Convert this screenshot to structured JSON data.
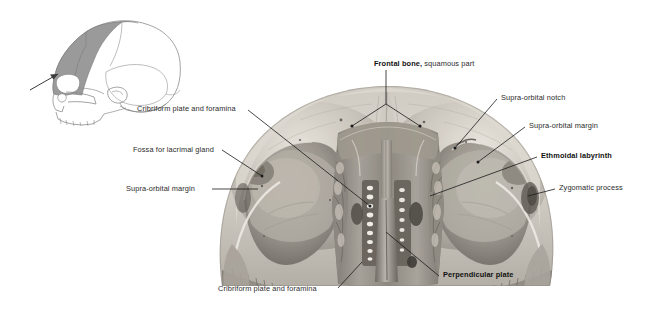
{
  "figure": {
    "background_color": "#ffffff",
    "text_color": "#2b2b2b",
    "bold_text_color": "#111111",
    "leader_color": "#1a1a1a"
  },
  "orientation_diagram": {
    "name": "lateral skull orientation key",
    "shaded_region_label": "frontal bone",
    "shaded_color": "#9a9a9a",
    "outline_color": "#8c8c8c",
    "arrow_direction": "up-right"
  },
  "specimen": {
    "name": "frontal bone with ethmoid",
    "view": "posterior",
    "tone_light": "#d8d4cd",
    "tone_mid": "#a9a49c",
    "tone_dark": "#6e6a63",
    "tone_shadow": "#4a4views"
  },
  "labels": [
    {
      "id": "frontal-bone",
      "bold_text": "Frontal bone,",
      "regular_text": " squamous part",
      "x": 374,
      "y": 64,
      "align": "left"
    },
    {
      "id": "cribriform-plate-upper",
      "text": "Cribriform plate and foramina",
      "x": 137,
      "y": 112,
      "align": "left"
    },
    {
      "id": "fossa-lacrimal-gland",
      "text": "Fossa for lacrimal gland",
      "x": 133,
      "y": 152,
      "align": "left"
    },
    {
      "id": "supra-orbital-margin-left",
      "text": "Supra-orbital margin",
      "x": 126,
      "y": 191,
      "align": "left"
    },
    {
      "id": "supra-orbital-notch",
      "text": "Supra-orbital notch",
      "x": 501,
      "y": 100,
      "align": "left"
    },
    {
      "id": "supra-orbital-margin-right",
      "text": "Supra-orbital margin",
      "x": 529,
      "y": 128,
      "align": "left"
    },
    {
      "id": "ethmoidal-labyrinth",
      "text": "Ethmoidal labyrinth",
      "x": 541,
      "y": 158,
      "align": "left",
      "bold": true
    },
    {
      "id": "zygomatic-process",
      "text": "Zygomatic process",
      "x": 559,
      "y": 190,
      "align": "left"
    },
    {
      "id": "perpendicular-plate",
      "text": "Perpendicular plate",
      "x": 443,
      "y": 277,
      "align": "left",
      "bold": true
    },
    {
      "id": "cribriform-plate-lower",
      "text": "Cribriform plate and foramina",
      "x": 218,
      "y": 291,
      "align": "left"
    }
  ]
}
